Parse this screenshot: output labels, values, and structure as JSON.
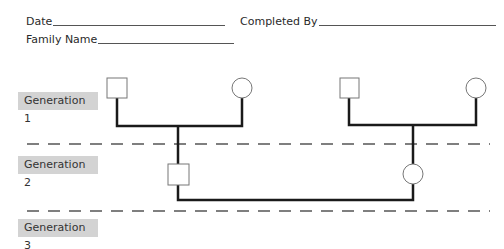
{
  "form": {
    "date_label": "Date",
    "completed_by_label": "Completed By",
    "family_name_label": "Family Name"
  },
  "generations": [
    {
      "label": "Generation 1"
    },
    {
      "label": "Generation 2"
    },
    {
      "label": "Generation 3"
    }
  ],
  "pedigree": {
    "generation_1": [
      {
        "symbol": "square",
        "meaning": "male"
      },
      {
        "symbol": "circle",
        "meaning": "female"
      },
      {
        "symbol": "square",
        "meaning": "male"
      },
      {
        "symbol": "circle",
        "meaning": "female"
      }
    ],
    "generation_2": [
      {
        "symbol": "square",
        "meaning": "male"
      },
      {
        "symbol": "circle",
        "meaning": "female"
      }
    ],
    "colors": {
      "line": "#1a1a1a",
      "label_bg": "#d3d3d3",
      "dash": "#555555"
    }
  }
}
